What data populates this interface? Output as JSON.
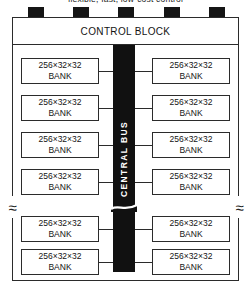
{
  "figure": {
    "caption_clipped": "flexible, fast, low-cost control",
    "control_block": {
      "label": "CONTROL BLOCK"
    },
    "central_bus": {
      "label": "CENTRAL BUS"
    },
    "bank": {
      "size_label": "256×32×32",
      "name_label": "BANK"
    },
    "break_symbol": "≈",
    "top_pins": [
      {
        "name": "pin-1"
      },
      {
        "name": "pin-2"
      },
      {
        "name": "pin-3"
      },
      {
        "name": "pin-4"
      },
      {
        "name": "pin-5"
      }
    ],
    "banks_left": [
      {
        "size": "256×32×32",
        "name": "BANK",
        "top": 58
      },
      {
        "size": "256×32×32",
        "name": "BANK",
        "top": 95
      },
      {
        "size": "256×32×32",
        "name": "BANK",
        "top": 132
      },
      {
        "size": "256×32×32",
        "name": "BANK",
        "top": 169
      },
      {
        "size": "256×32×32",
        "name": "BANK",
        "top": 216
      },
      {
        "size": "256×32×32",
        "name": "BANK",
        "top": 249
      }
    ],
    "banks_right": [
      {
        "size": "256×32×32",
        "name": "BANK",
        "top": 58
      },
      {
        "size": "256×32×32",
        "name": "BANK",
        "top": 95
      },
      {
        "size": "256×32×32",
        "name": "BANK",
        "top": 132
      },
      {
        "size": "256×32×32",
        "name": "BANK",
        "top": 169
      },
      {
        "size": "256×32×32",
        "name": "BANK",
        "top": 216
      },
      {
        "size": "256×32×32",
        "name": "BANK",
        "top": 249
      }
    ],
    "colors": {
      "bus_fill": "#111111",
      "pin_fill": "#151515",
      "line": "#2b2b2b",
      "background": "#ffffff",
      "bus_text": "#ffffff"
    }
  }
}
